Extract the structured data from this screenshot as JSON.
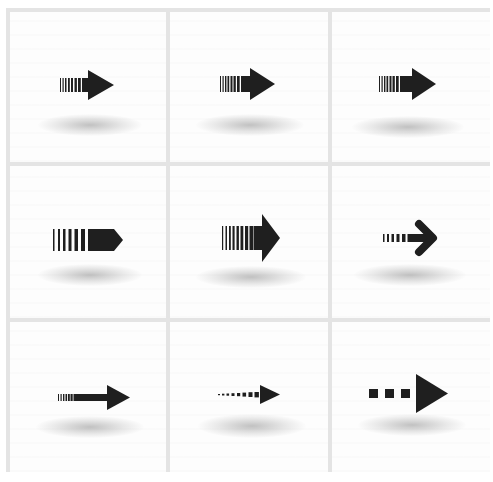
{
  "colors": {
    "arrow": "#1f1f1f",
    "grid_line": "#e4e4e4",
    "cell_bg": "#fdfdfd",
    "shadow": "#9a9a9a"
  },
  "grid": {
    "rows": 3,
    "columns": 3
  },
  "cells": [
    {
      "id": 1,
      "icon": "striped-arrow-right-icon",
      "style": "fine stripes tail, solid triangular head"
    },
    {
      "id": 2,
      "icon": "striped-arrow-right-icon",
      "style": "fine stripes tail, solid triangular head"
    },
    {
      "id": 3,
      "icon": "striped-arrow-right-icon",
      "style": "fine stripes tail, solid triangular head"
    },
    {
      "id": 4,
      "icon": "striped-pentagon-arrow-icon",
      "style": "wide stripes tail, pentagon tag head"
    },
    {
      "id": 5,
      "icon": "striped-arrow-right-icon",
      "style": "wide stripes tail, large triangular head"
    },
    {
      "id": 6,
      "icon": "dashed-chevron-arrow-icon",
      "style": "dashed tail, rounded chevron head"
    },
    {
      "id": 7,
      "icon": "long-striped-arrow-icon",
      "style": "thin stripes, long shaft, triangular head"
    },
    {
      "id": 8,
      "icon": "dotted-arrow-right-icon",
      "style": "dotted tail, small triangular head"
    },
    {
      "id": 9,
      "icon": "square-dots-arrow-icon",
      "style": "three square dots, large triangle head"
    }
  ]
}
